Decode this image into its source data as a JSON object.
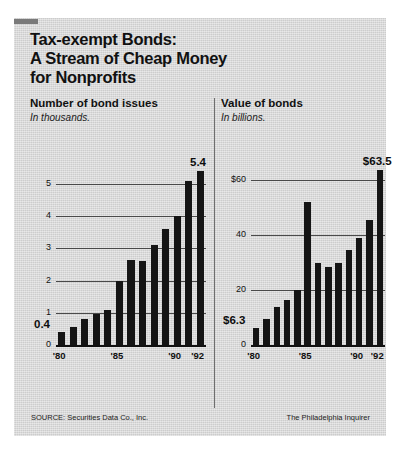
{
  "title": {
    "line1": "Tax-exempt Bonds:",
    "line2": "A Stream of Cheap Money",
    "line3": "for Nonprofits"
  },
  "footer": {
    "source": "SOURCE: Securities Data Co., Inc.",
    "credit": "The Philadelphia Inquirer"
  },
  "colors": {
    "background": "#d9d9d9",
    "bar": "#151515",
    "gridline": "#4a4a4a",
    "text": "#111111"
  },
  "chart_data": [
    {
      "type": "bar",
      "panel": "left",
      "title": "Number of bond issues",
      "subtitle": "In thousands.",
      "xlabel": "",
      "ylabel": "",
      "ylim": [
        0,
        5.8
      ],
      "grid": true,
      "yticks": [
        0,
        1,
        2,
        3,
        4,
        5
      ],
      "ytick_labels": [
        "0",
        "1",
        "2",
        "3",
        "4",
        "5"
      ],
      "categories": [
        "'80",
        "'81",
        "'82",
        "'83",
        "'84",
        "'85",
        "'86",
        "'87",
        "'88",
        "'89",
        "'90",
        "'91",
        "'92"
      ],
      "xtick_labels": [
        "'80",
        "'85",
        "'90",
        "'92"
      ],
      "xtick_indices": [
        0,
        5,
        10,
        12
      ],
      "values": [
        0.4,
        0.55,
        0.8,
        0.95,
        1.1,
        2.0,
        2.65,
        2.6,
        3.1,
        3.6,
        4.0,
        5.1,
        5.4
      ],
      "annotations": [
        {
          "label": "0.4",
          "index": 0,
          "position": "left-above-first-bar"
        },
        {
          "label": "5.4",
          "index": 12,
          "position": "above-last-bar"
        }
      ]
    },
    {
      "type": "bar",
      "panel": "right",
      "title": "Value of bonds",
      "subtitle": "In billions.",
      "xlabel": "",
      "ylabel": "",
      "ylim": [
        0,
        68
      ],
      "grid": true,
      "yticks": [
        0,
        20,
        40,
        60
      ],
      "ytick_labels": [
        "0",
        "20",
        "40",
        "$60"
      ],
      "categories": [
        "'80",
        "'81",
        "'82",
        "'83",
        "'84",
        "'85",
        "'86",
        "'87",
        "'88",
        "'89",
        "'90",
        "'91",
        "'92"
      ],
      "xtick_labels": [
        "'80",
        "'85",
        "'90",
        "'92"
      ],
      "xtick_indices": [
        0,
        5,
        10,
        12
      ],
      "values": [
        6.3,
        9.5,
        14.0,
        16.5,
        20.0,
        52.0,
        30.0,
        28.5,
        30.0,
        34.5,
        39.0,
        45.5,
        63.5
      ],
      "annotations": [
        {
          "label": "$6.3",
          "index": 0,
          "position": "left-above-first-bar"
        },
        {
          "label": "$63.5",
          "index": 12,
          "position": "above-last-bar"
        }
      ]
    }
  ]
}
